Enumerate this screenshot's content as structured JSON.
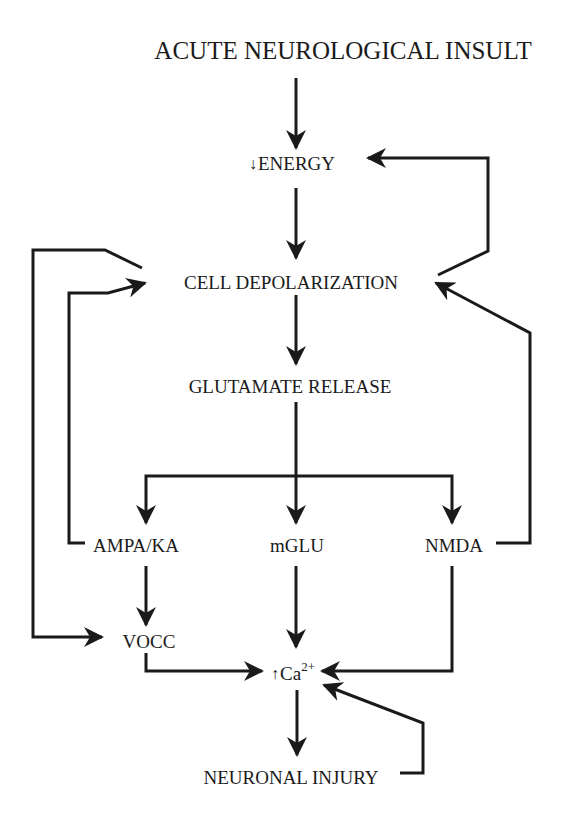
{
  "diagram": {
    "colors": {
      "line": "#1a1a1a",
      "background": "#ffffff"
    },
    "nodes": {
      "insult": {
        "label": "ACUTE NEUROLOGICAL INSULT"
      },
      "energy": {
        "prefix_icon": "down-arrow",
        "prefix": "↓",
        "label": "ENERGY"
      },
      "depolarization": {
        "label": "CELL DEPOLARIZATION"
      },
      "glutamate": {
        "label": "GLUTAMATE RELEASE"
      },
      "ampa": {
        "label": "AMPA/KA"
      },
      "mglu": {
        "label": "mGLU"
      },
      "nmda": {
        "label": "NMDA"
      },
      "vocc": {
        "label": "VOCC"
      },
      "calcium": {
        "prefix_icon": "up-arrow",
        "prefix": "↑",
        "label": "Ca",
        "superscript": "2+"
      },
      "injury": {
        "label": "NEURONAL INJURY"
      }
    },
    "edges": [
      {
        "from": "ACUTE NEUROLOGICAL INSULT",
        "to": "ENERGY (decrease)"
      },
      {
        "from": "ENERGY (decrease)",
        "to": "CELL DEPOLARIZATION"
      },
      {
        "from": "CELL DEPOLARIZATION",
        "to": "ENERGY (decrease)",
        "type": "feedback"
      },
      {
        "from": "CELL DEPOLARIZATION",
        "to": "GLUTAMATE RELEASE"
      },
      {
        "from": "CELL DEPOLARIZATION",
        "to": "VOCC"
      },
      {
        "from": "GLUTAMATE RELEASE",
        "to": "AMPA/KA"
      },
      {
        "from": "GLUTAMATE RELEASE",
        "to": "mGLU"
      },
      {
        "from": "GLUTAMATE RELEASE",
        "to": "NMDA"
      },
      {
        "from": "AMPA/KA",
        "to": "CELL DEPOLARIZATION",
        "type": "feedback"
      },
      {
        "from": "NMDA",
        "to": "CELL DEPOLARIZATION",
        "type": "feedback"
      },
      {
        "from": "AMPA/KA",
        "to": "VOCC"
      },
      {
        "from": "VOCC",
        "to": "Ca2+ (increase)"
      },
      {
        "from": "mGLU",
        "to": "Ca2+ (increase)"
      },
      {
        "from": "NMDA",
        "to": "Ca2+ (increase)"
      },
      {
        "from": "Ca2+ (increase)",
        "to": "NEURONAL INJURY"
      },
      {
        "from": "NEURONAL INJURY",
        "to": "Ca2+ (increase)",
        "type": "feedback"
      }
    ]
  }
}
